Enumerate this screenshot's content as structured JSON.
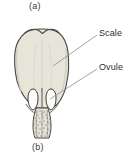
{
  "figure": {
    "panels": [
      {
        "id": "a",
        "label": "(a)",
        "position": "top"
      },
      {
        "id": "b",
        "label": "(b)",
        "position": "bottom"
      }
    ],
    "callouts": [
      {
        "name": "scale",
        "label": "Scale"
      },
      {
        "name": "ovule",
        "label": "Ovule"
      }
    ],
    "colors": {
      "background": "#ffffff",
      "scale_fill": "#e7e5da",
      "scale_outline": "#474741",
      "ovule_fill": "#fdfdfb",
      "ovule_outline": "#3a3a36",
      "stalk_fill": "#e3e1d8",
      "stalk_stipple": "#4a4a44",
      "leader_line": "#8b8b86",
      "text": "#2e2e2e"
    },
    "structures": [
      {
        "name": "ovuliferous-scale",
        "count": 1
      },
      {
        "name": "ovule",
        "count": 2
      },
      {
        "name": "stalk",
        "count": 1
      }
    ]
  }
}
